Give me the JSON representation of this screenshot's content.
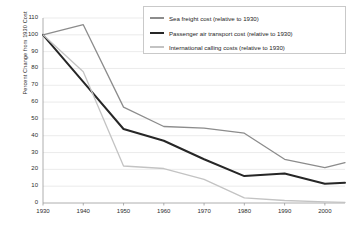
{
  "chart_data": {
    "type": "line",
    "title": "",
    "xlabel": "",
    "ylabel": "Percent Change from 1930 Cost",
    "xlim": [
      1930,
      2005
    ],
    "ylim": [
      0,
      110
    ],
    "grid": true,
    "legend_position": "top-right",
    "x_ticks": [
      "1930",
      "1940",
      "1950",
      "1960",
      "1970",
      "1980",
      "1990",
      "2000"
    ],
    "y_ticks": [
      "0",
      "10",
      "20",
      "30",
      "40",
      "50",
      "60",
      "70",
      "80",
      "90",
      "100",
      "110"
    ],
    "x": [
      1930,
      1940,
      1950,
      1960,
      1970,
      1980,
      1990,
      2000,
      2005
    ],
    "series": [
      {
        "name": "Sea freight cost (relative to 1930)",
        "color": "#8c8c8c",
        "width": 1.3,
        "values": [
          100,
          106,
          57,
          45.5,
          44.5,
          41.5,
          26,
          21,
          24
        ]
      },
      {
        "name": "Passenger air transport cost (relative to 1930)",
        "color": "#262626",
        "width": 2.0,
        "values": [
          100,
          72,
          44,
          37,
          26,
          16,
          17.5,
          11.5,
          12
        ]
      },
      {
        "name": "International calling costs (relative to 1930)",
        "color": "#c3c3c3",
        "width": 1.3,
        "values": [
          100,
          78,
          22,
          20.5,
          14,
          3,
          1.5,
          0.7,
          0.4
        ]
      }
    ]
  },
  "axis": {
    "y_title": "Percent Change from 1930 Cost"
  },
  "legend": {
    "items": [
      {
        "label": "Sea freight cost (relative to 1930)"
      },
      {
        "label": "Passenger air transport cost (relative to 1930)"
      },
      {
        "label": "International calling costs (relative to 1930)"
      }
    ]
  },
  "colors": {
    "sea_freight": "#8c8c8c",
    "air_transport": "#262626",
    "calling": "#c3c3c3",
    "grid": "#e2e2e2",
    "axis": "#9a9a9a",
    "text": "#2b2b2b"
  }
}
